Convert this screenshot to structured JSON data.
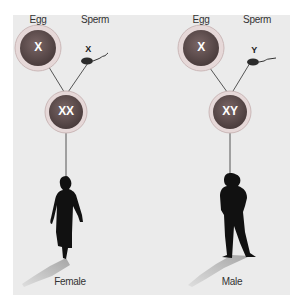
{
  "colors": {
    "panel_bg": "#ebebeb",
    "cell_fill": "#5a4b4b",
    "cell_ring": "#d9c5c5",
    "line": "#555555",
    "silhouette": "#111111",
    "shadow": "#bdbdbd"
  },
  "left": {
    "egg_label": "Egg",
    "sperm_label": "Sperm",
    "egg_chromosome": "X",
    "sperm_chromosome": "X",
    "zygote_chromosomes": "XX",
    "result_label": "Female",
    "figure_icon": "woman-silhouette-icon"
  },
  "right": {
    "egg_label": "Egg",
    "sperm_label": "Sperm",
    "egg_chromosome": "X",
    "sperm_chromosome": "Y",
    "zygote_chromosomes": "XY",
    "result_label": "Male",
    "figure_icon": "man-silhouette-icon"
  }
}
